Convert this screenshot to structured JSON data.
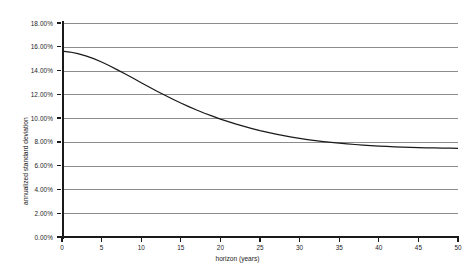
{
  "chart_data": {
    "type": "line",
    "title": "",
    "xlabel": "horizon (years)",
    "ylabel": "annualized standard deviation",
    "xlim": [
      0,
      50
    ],
    "ylim": [
      0,
      0.18
    ],
    "grid": "horizontal",
    "legend": "none",
    "line_color": "#1a1a1a",
    "grid_color": "#8c8c8c",
    "axis_color": "#1a1a1a",
    "background_color": "#ffffff",
    "x_ticks": [
      0,
      5,
      10,
      15,
      20,
      25,
      30,
      35,
      40,
      45,
      50
    ],
    "x_tick_labels": [
      "0",
      "5",
      "10",
      "15",
      "20",
      "25",
      "30",
      "35",
      "40",
      "45",
      "50"
    ],
    "y_ticks": [
      0,
      0.02,
      0.04,
      0.06,
      0.08,
      0.1,
      0.12,
      0.14,
      0.16,
      0.18
    ],
    "y_tick_labels": [
      "0.00%",
      "2.00%",
      "4.00%",
      "6.00%",
      "8.00%",
      "10.00%",
      "12.00%",
      "14.00%",
      "16.00%",
      "18.00%"
    ],
    "series": [
      {
        "name": "annualized standard deviation",
        "x": [
          0,
          0,
          1,
          2,
          3,
          4,
          5,
          6,
          7,
          8,
          9,
          10,
          11,
          12,
          13,
          14,
          15,
          16,
          17,
          18,
          19,
          20,
          21,
          22,
          23,
          24,
          25,
          26,
          27,
          28,
          29,
          30,
          31,
          32,
          33,
          34,
          35,
          36,
          37,
          38,
          39,
          40,
          41,
          42,
          43,
          44,
          45,
          46,
          47,
          48,
          49,
          50
        ],
        "values": [
          0.153,
          0.1563,
          0.1556,
          0.1543,
          0.1524,
          0.15,
          0.1472,
          0.144,
          0.1406,
          0.1371,
          0.1335,
          0.1298,
          0.1262,
          0.1226,
          0.1192,
          0.1159,
          0.1127,
          0.1097,
          0.1068,
          0.1041,
          0.1016,
          0.0992,
          0.097,
          0.0949,
          0.093,
          0.0912,
          0.0895,
          0.088,
          0.0866,
          0.0853,
          0.0841,
          0.083,
          0.082,
          0.0811,
          0.0803,
          0.0796,
          0.0789,
          0.0783,
          0.0778,
          0.0773,
          0.0769,
          0.0765,
          0.0762,
          0.0759,
          0.0756,
          0.0754,
          0.0752,
          0.075,
          0.0749,
          0.0748,
          0.0747,
          0.0746
        ]
      }
    ]
  }
}
